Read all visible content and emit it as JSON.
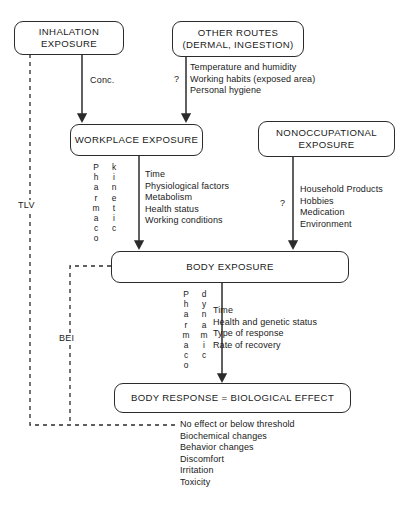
{
  "diagram": {
    "line_color": "#2b2b2b",
    "text_color": "#1a1a1a",
    "background": "#ffffff"
  },
  "nodes": {
    "inhalation": {
      "line1": "INHALATION",
      "line2": "EXPOSURE"
    },
    "other_routes": {
      "line1": "OTHER ROUTES",
      "line2": "(DERMAL, INGESTION)"
    },
    "workplace": {
      "line1": "WORKPLACE EXPOSURE"
    },
    "nonoccupational": {
      "line1": "NONOCCUPATIONAL",
      "line2": "EXPOSURE"
    },
    "body_exposure": {
      "line1": "BODY EXPOSURE"
    },
    "body_response": {
      "line1": "BODY RESPONSE = BIOLOGICAL EFFECT"
    }
  },
  "edge_labels": {
    "conc": "Conc.",
    "question_other_routes": "?",
    "question_nonoccupational": "?",
    "tlv": "TLV",
    "bei": "BEI"
  },
  "vertical_labels": {
    "pharmaco_1": "Pharmaco",
    "kinetic": "kinetic",
    "pharmaco_2": "Pharmaco",
    "dynamic": "dynamic"
  },
  "factor_lists": {
    "other_routes_factors": [
      "Temperature and humidity",
      "Working habits (exposed area)",
      "Personal hygiene"
    ],
    "workplace_factors": [
      "Time",
      "Physiological factors",
      "Metabolism",
      "Health status",
      "Working conditions"
    ],
    "nonoccupational_factors": [
      "Household Products",
      "Hobbies",
      "Medication",
      "Environment"
    ],
    "body_exposure_factors": [
      "Time",
      "Health and genetic status",
      "Type of response",
      "Rate of recovery"
    ],
    "body_response_outcomes": [
      "No effect or below threshold",
      "Biochemical changes",
      "Behavior changes",
      "Discomfort",
      "Irritation",
      "Toxicity"
    ]
  }
}
